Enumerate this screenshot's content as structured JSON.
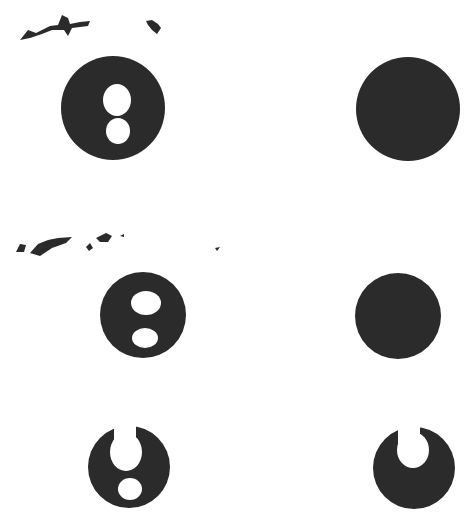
{
  "figure": {
    "background": "#ffffff",
    "ink_color": "#2b2b2b",
    "panels": [
      {
        "id": "row1-left",
        "cx": 113,
        "cy": 108,
        "r": 52,
        "holes": [
          {
            "cx": 117,
            "cy": 100,
            "rx": 14,
            "ry": 16
          },
          {
            "cx": 118,
            "cy": 131,
            "rx": 12,
            "ry": 13
          }
        ]
      },
      {
        "id": "row1-right",
        "cx": 408,
        "cy": 109,
        "r": 52,
        "holes": []
      },
      {
        "id": "row2-left",
        "cx": 143,
        "cy": 315,
        "r": 43,
        "holes": [
          {
            "cx": 146,
            "cy": 303,
            "rx": 15,
            "ry": 12
          },
          {
            "cx": 145,
            "cy": 338,
            "rx": 13,
            "ry": 10
          }
        ]
      },
      {
        "id": "row2-right",
        "cx": 398,
        "cy": 316,
        "r": 43,
        "holes": []
      },
      {
        "id": "row3-left",
        "cx": 129,
        "cy": 467,
        "r": 41,
        "holes": [
          {
            "cx": 126,
            "cy": 452,
            "rx": 16,
            "ry": 19
          },
          {
            "cx": 130,
            "cy": 489,
            "rx": 12,
            "ry": 11
          }
        ]
      },
      {
        "id": "row3-right",
        "cx": 414,
        "cy": 468,
        "r": 41,
        "holes": [
          {
            "cx": 413,
            "cy": 450,
            "rx": 16,
            "ry": 18
          }
        ]
      }
    ]
  }
}
